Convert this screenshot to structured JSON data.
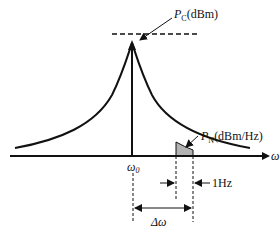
{
  "diagram": {
    "type": "phase-noise spectrum",
    "carrier_label": {
      "symbol": "P",
      "subscript": "C",
      "unit": "(dBm)"
    },
    "noise_label": {
      "symbol": "P",
      "subscript": "N",
      "unit": "(dBm/Hz)"
    },
    "axis_label": "ω",
    "center_label": {
      "symbol": "ω",
      "subscript": "0"
    },
    "bandwidth_label": "1Hz",
    "offset_label": "Δω",
    "colors": {
      "line": "#111111",
      "shade": "#b3b3b3"
    }
  }
}
